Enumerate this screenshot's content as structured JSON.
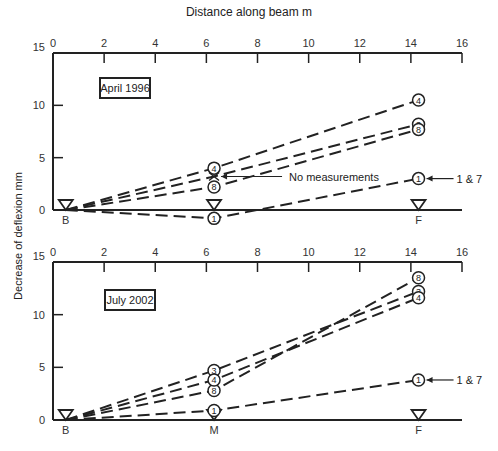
{
  "chart_data": [
    {
      "type": "line",
      "title": "April 1996",
      "xlabel": "Distance along beam m",
      "ylabel": "Decrease of deflexion mm",
      "xlim": [
        0,
        16
      ],
      "ylim": [
        0,
        15
      ],
      "xticks": [
        0,
        2,
        4,
        6,
        8,
        10,
        12,
        14,
        16
      ],
      "yticks": [
        0,
        5,
        10,
        15
      ],
      "supports": [
        {
          "label": "B",
          "x": 0.5
        },
        {
          "label": "M",
          "x": 6.3
        },
        {
          "label": "F",
          "x": 14.3
        }
      ],
      "series": [
        {
          "name": "4",
          "x": [
            0.5,
            6.3,
            14.3
          ],
          "y": [
            0,
            4.0,
            10.5
          ]
        },
        {
          "name": "3",
          "x": [
            0.5,
            6.3,
            14.3
          ],
          "y": [
            0,
            3.2,
            8.2
          ],
          "note": "No measurements at M"
        },
        {
          "name": "8",
          "x": [
            0.5,
            6.3,
            14.3
          ],
          "y": [
            0,
            2.2,
            7.7
          ]
        },
        {
          "name": "1",
          "x": [
            0.5,
            6.3,
            14.3
          ],
          "y": [
            0,
            -0.8,
            3.0
          ],
          "annotation": "1 & 7"
        }
      ],
      "annotations": [
        "No measurements",
        "1 & 7"
      ]
    },
    {
      "type": "line",
      "title": "July 2002",
      "xlabel": "Distance along beam m",
      "ylabel": "Decrease of deflexion mm",
      "xlim": [
        0,
        16
      ],
      "ylim": [
        0,
        15
      ],
      "xticks": [
        0,
        2,
        4,
        6,
        8,
        10,
        12,
        14,
        16
      ],
      "yticks": [
        0,
        5,
        10,
        15
      ],
      "supports": [
        {
          "label": "B",
          "x": 0.5
        },
        {
          "label": "M",
          "x": 6.3
        },
        {
          "label": "F",
          "x": 14.3
        }
      ],
      "series": [
        {
          "name": "8",
          "x": [
            0.5,
            6.3,
            14.3
          ],
          "y": [
            0,
            2.8,
            13.5
          ]
        },
        {
          "name": "3",
          "x": [
            0.5,
            6.3,
            14.3
          ],
          "y": [
            0,
            4.7,
            12.2
          ]
        },
        {
          "name": "4",
          "x": [
            0.5,
            6.3,
            14.3
          ],
          "y": [
            0,
            3.8,
            11.6
          ]
        },
        {
          "name": "1",
          "x": [
            0.5,
            6.3,
            14.3
          ],
          "y": [
            0,
            0.9,
            3.8
          ],
          "annotation": "1 & 7"
        }
      ],
      "annotations": [
        "1 & 7"
      ]
    }
  ],
  "labels": {
    "xaxis_title": "Distance along beam m",
    "yaxis_title": "Decrease of deflexion mm",
    "top_title": "April 1996",
    "bottom_title": "July 2002",
    "no_measurements": "No measurements",
    "one_and_seven": "1 & 7",
    "support_B": "B",
    "support_M": "M",
    "support_F": "F"
  }
}
